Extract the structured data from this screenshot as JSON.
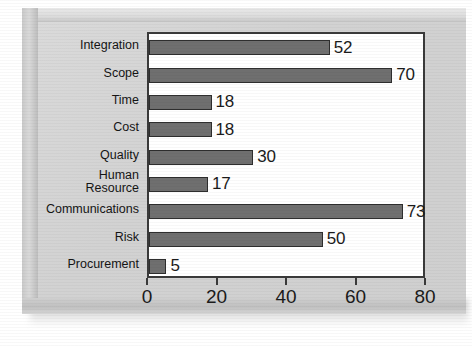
{
  "chart_data": {
    "type": "bar",
    "orientation": "horizontal",
    "title": "",
    "xlabel": "",
    "ylabel": "",
    "categories": [
      "Integration",
      "Scope",
      "Time",
      "Cost",
      "Quality",
      "Human Resource",
      "Communications",
      "Risk",
      "Procurement"
    ],
    "category_lines": [
      [
        "Integration"
      ],
      [
        "Scope"
      ],
      [
        "Time"
      ],
      [
        "Cost"
      ],
      [
        "Quality"
      ],
      [
        "Human",
        "Resource"
      ],
      [
        "Communications"
      ],
      [
        "Risk"
      ],
      [
        "Procurement"
      ]
    ],
    "values": [
      52,
      70,
      18,
      18,
      30,
      17,
      73,
      50,
      5
    ],
    "value_labels": [
      "52",
      "70",
      "18",
      "18",
      "30",
      "17",
      "73",
      "50",
      "5"
    ],
    "xlim": [
      0,
      80
    ],
    "xticks": [
      0,
      20,
      40,
      60,
      80
    ],
    "xtick_labels": [
      "0",
      "20",
      "40",
      "60",
      "80"
    ],
    "grid": false,
    "legend": false,
    "bar_color": "#6f6f6f",
    "bar_border_color": "#2e2e2e",
    "plot_background": "#ffffff",
    "axis_color": "#3a3a3a",
    "panel_background": "#d5d5d5"
  }
}
